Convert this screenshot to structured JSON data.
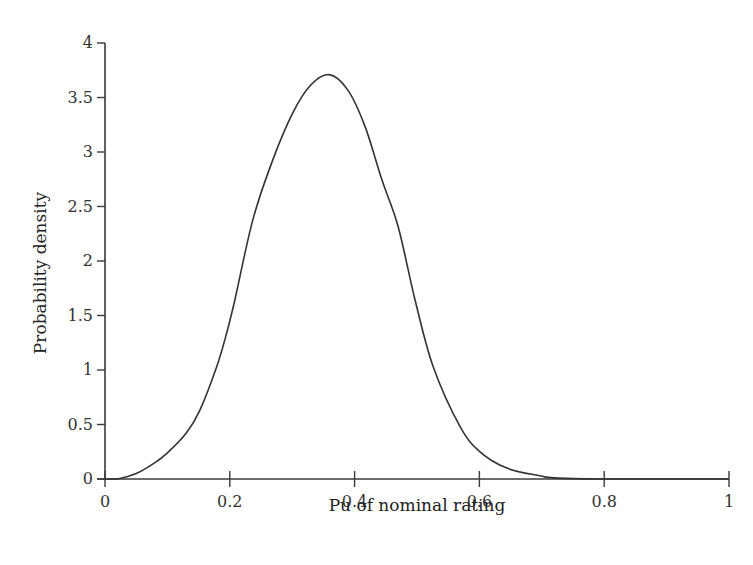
{
  "chart_data": {
    "type": "line",
    "title": "",
    "xlabel": "Pu of nominal rating",
    "ylabel": "Probability density",
    "xlim": [
      0,
      1
    ],
    "ylim": [
      0,
      4
    ],
    "grid": false,
    "legend": null,
    "x_ticks": [
      "0",
      "0.2",
      "0.4",
      "0.6",
      "0.8",
      "1"
    ],
    "y_ticks": [
      "0",
      "0.5",
      "1",
      "1.5",
      "2",
      "2.5",
      "3",
      "3.5",
      "4"
    ],
    "series": [
      {
        "name": "Probability density",
        "color": "#333333",
        "x": [
          0.0,
          0.02,
          0.05,
          0.08,
          0.1,
          0.13,
          0.152,
          0.179,
          0.195,
          0.208,
          0.237,
          0.269,
          0.301,
          0.329,
          0.359,
          0.389,
          0.417,
          0.444,
          0.47,
          0.497,
          0.526,
          0.569,
          0.601,
          0.644,
          0.697,
          0.72,
          0.8,
          0.9,
          1.0
        ],
        "values": [
          0.0,
          0.0,
          0.05,
          0.15,
          0.24,
          0.42,
          0.63,
          1.03,
          1.34,
          1.64,
          2.38,
          2.93,
          3.36,
          3.61,
          3.71,
          3.57,
          3.23,
          2.74,
          2.31,
          1.64,
          1.03,
          0.48,
          0.25,
          0.1,
          0.03,
          0.01,
          0.0,
          0.0,
          0.0
        ]
      }
    ],
    "annotations": []
  },
  "layout": {
    "plot_left": 105,
    "plot_right": 729,
    "plot_top": 43,
    "plot_bottom": 479
  }
}
